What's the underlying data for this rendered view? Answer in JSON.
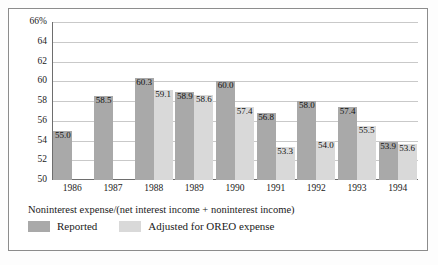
{
  "chart_data": {
    "type": "bar",
    "title": "",
    "subtitle": "",
    "caption": "Noninterest expense/(net interest income + noninterest income)",
    "xlabel": "",
    "ylabel": "",
    "ylim": [
      50,
      66
    ],
    "grid": true,
    "legend_position": "bottom-left",
    "categories": [
      "1986",
      "1987",
      "1988",
      "1989",
      "1990",
      "1991",
      "1992",
      "1993",
      "1994"
    ],
    "ytick_labels": [
      "50",
      "52",
      "54",
      "56",
      "58",
      "60",
      "62",
      "64",
      "66%"
    ],
    "ytick_values": [
      50,
      52,
      54,
      56,
      58,
      60,
      62,
      64,
      66
    ],
    "series": [
      {
        "name": "Reported",
        "color": "#a9a9a9",
        "values": [
          55.0,
          58.5,
          60.3,
          58.9,
          60.0,
          56.8,
          58.0,
          57.4,
          53.9
        ],
        "labels": [
          "55.0",
          "58.5",
          "60.3",
          "58.9",
          "60.0",
          "56.8",
          "58.0",
          "57.4",
          "53.9"
        ]
      },
      {
        "name": "Adjusted for OREO expense",
        "color": "#d9d9d9",
        "values": [
          null,
          null,
          59.1,
          58.6,
          57.4,
          53.3,
          54.0,
          55.5,
          53.6
        ],
        "labels": [
          "",
          "",
          "59.1",
          "58.6",
          "57.4",
          "53.3",
          "54.0",
          "55.5",
          "53.6"
        ]
      }
    ]
  },
  "legend": {
    "items": [
      {
        "label": "Reported",
        "color": "#a9a9a9"
      },
      {
        "label": "Adjusted for OREO expense",
        "color": "#d9d9d9"
      }
    ]
  }
}
